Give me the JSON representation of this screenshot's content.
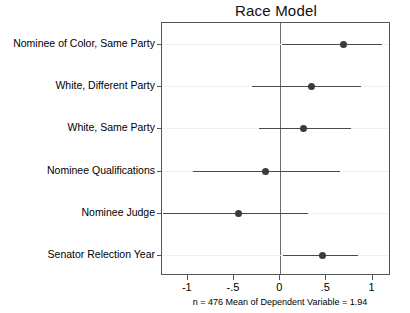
{
  "chart_data": {
    "type": "scatter",
    "plot_style": "coefficient-dot-whisker",
    "title": "Race Model",
    "xlabel": "",
    "ylabel": "",
    "xlim": [
      -1.28,
      1.2
    ],
    "xticks": [
      -1,
      -0.5,
      0,
      0.5,
      1
    ],
    "xticklabels": [
      "-1",
      "-.5",
      "0",
      ".5",
      "1"
    ],
    "grid": true,
    "zero_reference_line": 0,
    "legend": "none",
    "categories": [
      "Nominee of Color, Same Party",
      "White, Different Party",
      "White, Same Party",
      "Nominee Qualifications",
      "Nominee Judge",
      "Senator Relection Year"
    ],
    "values": [
      0.69,
      0.34,
      0.25,
      -0.16,
      -0.45,
      0.46
    ],
    "ci_low": [
      0.02,
      -0.31,
      -0.23,
      -0.94,
      -1.27,
      0.03
    ],
    "ci_high": [
      1.1,
      0.88,
      0.77,
      0.65,
      0.3,
      0.84
    ],
    "series": [
      {
        "name": "Coefficient estimate with 95% confidence interval",
        "points": [
          {
            "label": "Nominee of Color, Same Party",
            "estimate": 0.69,
            "ci_low": 0.02,
            "ci_high": 1.1
          },
          {
            "label": "White, Different Party",
            "estimate": 0.34,
            "ci_low": -0.31,
            "ci_high": 0.88
          },
          {
            "label": "White, Same Party",
            "estimate": 0.25,
            "ci_low": -0.23,
            "ci_high": 0.77
          },
          {
            "label": "Nominee Qualifications",
            "estimate": -0.16,
            "ci_low": -0.94,
            "ci_high": 0.65
          },
          {
            "label": "Nominee Judge",
            "estimate": -0.45,
            "ci_low": -1.27,
            "ci_high": 0.3
          },
          {
            "label": "Senator Relection Year",
            "estimate": 0.46,
            "ci_low": 0.03,
            "ci_high": 0.84
          }
        ]
      }
    ],
    "annotations": [
      "n = 476 Mean of Dependent Variable = 1.94"
    ],
    "colors": {
      "point": "#3b3b3b",
      "interval": "#4a4a4a",
      "zero_line": "#6d6d6d",
      "frame": "#555555",
      "grid": "#f0f0f0",
      "background": "#ffffff"
    }
  },
  "footnote": "n = 476 Mean of Dependent Variable = 1.94"
}
